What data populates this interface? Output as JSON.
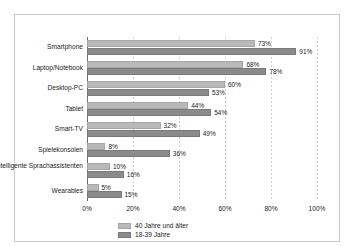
{
  "chart_data": {
    "type": "bar",
    "orientation": "horizontal",
    "title": "",
    "xlabel": "",
    "ylabel": "",
    "xlim": [
      0,
      100
    ],
    "xticks": [
      "0%",
      "20%",
      "40%",
      "60%",
      "80%",
      "100%"
    ],
    "xtick_values": [
      0,
      20,
      40,
      60,
      80,
      100
    ],
    "grid": true,
    "legend_position": "bottom-center",
    "categories": [
      "Smartphone",
      "Laptop/Notebook",
      "Desktop-PC",
      "Tablet",
      "Smart-TV",
      "Spielekonsolen",
      "Intelligente Sprachassistenten",
      "Wearables"
    ],
    "series": [
      {
        "name": "40 Jahre und älter",
        "color": "#b9b9b9",
        "values": [
          73,
          68,
          60,
          44,
          32,
          8,
          10,
          5
        ],
        "labels": [
          "73%",
          "68%",
          "60%",
          "44%",
          "32%",
          "8%",
          "10%",
          "5%"
        ]
      },
      {
        "name": "18-39 Jahre",
        "color": "#8b8b8b",
        "values": [
          91,
          78,
          53,
          54,
          49,
          36,
          16,
          15
        ],
        "labels": [
          "91%",
          "78%",
          "53%",
          "54%",
          "49%",
          "36%",
          "16%",
          "15%"
        ]
      }
    ]
  },
  "legend": {
    "items": [
      {
        "label": "40 Jahre und älter",
        "color": "#b9b9b9"
      },
      {
        "label": "18-39 Jahre",
        "color": "#8b8b8b"
      }
    ]
  }
}
